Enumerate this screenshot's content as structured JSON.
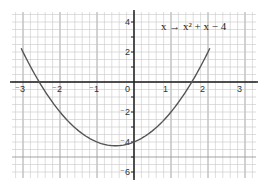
{
  "chart_data": {
    "type": "line",
    "title": "",
    "function_label": "x → x² + x − 4",
    "xlabel": "",
    "ylabel": "",
    "xlim": [
      -3.3,
      3.3
    ],
    "ylim": [
      -6.3,
      4.7
    ],
    "x_ticks": [
      -3,
      -2,
      -1,
      0,
      1,
      2,
      3
    ],
    "x_tick_labels": [
      "⁻3",
      "⁻2",
      "⁻1",
      "0",
      "1",
      "2",
      "3"
    ],
    "y_ticks": [
      4,
      2,
      -2,
      -4,
      -6
    ],
    "y_tick_labels": [
      "4",
      "2",
      "⁻2",
      "⁻4",
      "⁻6"
    ],
    "grid": true,
    "series": [
      {
        "name": "x² + x − 4",
        "x": [
          -3.05,
          -3,
          -2.5,
          -2,
          -1.5,
          -1,
          -0.5,
          0,
          0.5,
          1,
          1.5,
          2,
          2.05
        ],
        "y": [
          2.25,
          2,
          -0.25,
          -2,
          -3.25,
          -4,
          -4.25,
          -4,
          -3.25,
          -2,
          -0.25,
          2,
          2.25
        ]
      }
    ],
    "roots": [
      -2.56,
      1.56
    ],
    "vertex": [
      -0.5,
      -4.25
    ],
    "y_intercept": -4
  },
  "colors": {
    "grid_minor": "#c8c8c8",
    "grid_major": "#9a9a9a",
    "axis": "#222222",
    "curve": "#555555"
  }
}
